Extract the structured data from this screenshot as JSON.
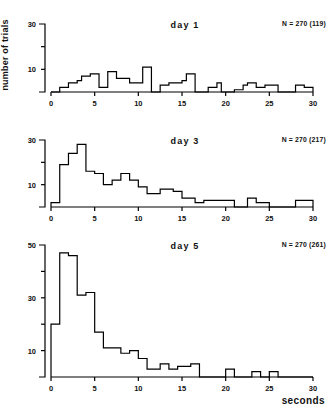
{
  "figure": {
    "axis_label_y": "number of trials",
    "axis_label_x": "seconds",
    "line_color": "#000000",
    "background": "#ffffff"
  },
  "chart_data": [
    {
      "type": "bar",
      "title": "day 1",
      "annotation": "N = 270 (119)",
      "xlabel": "",
      "ylabel": "number of trials",
      "xlim": [
        0,
        30
      ],
      "ylim": [
        0,
        32
      ],
      "xticks": [
        0,
        5,
        10,
        15,
        20,
        25,
        30
      ],
      "yticks": [
        10,
        30
      ],
      "yticks_minor": [
        20
      ],
      "grid": false,
      "bin_width": 0.5,
      "bin_starts": [
        0,
        0.5,
        1,
        1.5,
        2,
        2.5,
        3,
        3.5,
        4,
        4.5,
        5,
        5.5,
        6,
        6.5,
        7,
        7.5,
        8,
        8.5,
        9,
        9.5,
        10,
        10.5,
        11,
        11.5,
        12,
        12.5,
        13,
        13.5,
        14,
        14.5,
        15,
        15.5,
        16,
        16.5,
        17,
        17.5,
        18,
        18.5,
        19,
        19.5,
        20,
        20.5,
        21,
        21.5,
        22,
        22.5,
        23,
        23.5,
        24,
        24.5,
        25,
        25.5,
        26,
        26.5,
        27,
        27.5,
        28,
        28.5,
        29,
        29.5
      ],
      "values": [
        0,
        0,
        2,
        2,
        4,
        4,
        5,
        7,
        7,
        8,
        8,
        2,
        2,
        9,
        9,
        6,
        6,
        6,
        4,
        4,
        4,
        11,
        11,
        0,
        0,
        3,
        3,
        4,
        4,
        4,
        5,
        8,
        8,
        0,
        0,
        0,
        2,
        2,
        4,
        0,
        0,
        0,
        1,
        1,
        3,
        4,
        4,
        2,
        2,
        3,
        3,
        3,
        0,
        0,
        0,
        0,
        3,
        3,
        2,
        2
      ]
    },
    {
      "type": "bar",
      "title": "day 3",
      "annotation": "N = 270 (217)",
      "xlabel": "",
      "ylabel": "",
      "xlim": [
        0,
        30
      ],
      "ylim": [
        0,
        32
      ],
      "xticks": [
        0,
        5,
        10,
        15,
        20,
        25,
        30
      ],
      "yticks": [
        10,
        30
      ],
      "yticks_minor": [
        20
      ],
      "grid": false,
      "bin_width": 0.5,
      "bin_starts": [
        0,
        0.5,
        1,
        1.5,
        2,
        2.5,
        3,
        3.5,
        4,
        4.5,
        5,
        5.5,
        6,
        6.5,
        7,
        7.5,
        8,
        8.5,
        9,
        9.5,
        10,
        10.5,
        11,
        11.5,
        12,
        12.5,
        13,
        13.5,
        14,
        14.5,
        15,
        15.5,
        16,
        16.5,
        17,
        17.5,
        18,
        18.5,
        19,
        19.5,
        20,
        20.5,
        21,
        21.5,
        22,
        22.5,
        23,
        23.5,
        24,
        24.5,
        25,
        25.5,
        26,
        26.5,
        27,
        27.5,
        28,
        28.5,
        29,
        29.5
      ],
      "values": [
        2,
        2,
        19,
        19,
        24,
        24,
        28,
        28,
        16,
        16,
        15,
        15,
        10,
        10,
        12,
        12,
        15,
        15,
        12,
        12,
        9,
        9,
        6,
        6,
        6,
        8,
        8,
        8,
        7,
        7,
        4,
        4,
        4,
        2,
        2,
        3,
        3,
        3,
        3,
        3,
        3,
        3,
        0,
        0,
        0,
        4,
        4,
        2,
        2,
        2,
        0,
        0,
        0,
        0,
        0,
        0,
        3,
        3,
        3,
        3
      ]
    },
    {
      "type": "bar",
      "title": "day 5",
      "annotation": "N = 270 (261)",
      "xlabel": "seconds",
      "ylabel": "",
      "xlim": [
        0,
        30
      ],
      "ylim": [
        0,
        52
      ],
      "xticks": [
        0,
        5,
        10,
        15,
        20,
        25,
        30
      ],
      "yticks": [
        10,
        30,
        50
      ],
      "yticks_minor": [
        20,
        40
      ],
      "grid": false,
      "bin_width": 0.5,
      "bin_starts": [
        0,
        0.5,
        1,
        1.5,
        2,
        2.5,
        3,
        3.5,
        4,
        4.5,
        5,
        5.5,
        6,
        6.5,
        7,
        7.5,
        8,
        8.5,
        9,
        9.5,
        10,
        10.5,
        11,
        11.5,
        12,
        12.5,
        13,
        13.5,
        14,
        14.5,
        15,
        15.5,
        16,
        16.5,
        17,
        17.5,
        18,
        18.5,
        19,
        19.5,
        20,
        20.5,
        21,
        21.5,
        22,
        22.5,
        23,
        23.5,
        24,
        24.5,
        25,
        25.5,
        26,
        26.5,
        27,
        27.5,
        28,
        28.5,
        29,
        29.5
      ],
      "values": [
        20,
        20,
        47,
        47,
        46,
        46,
        31,
        31,
        32,
        32,
        17,
        17,
        11,
        11,
        11,
        11,
        9,
        9,
        10,
        10,
        7,
        7,
        3,
        3,
        3,
        5,
        5,
        3,
        3,
        4,
        4,
        4,
        5,
        5,
        0,
        0,
        0,
        0,
        0,
        0,
        3,
        3,
        0,
        0,
        0,
        0,
        2,
        2,
        0,
        0,
        2,
        2,
        0,
        0,
        0,
        0,
        0,
        0,
        0,
        0
      ]
    }
  ]
}
